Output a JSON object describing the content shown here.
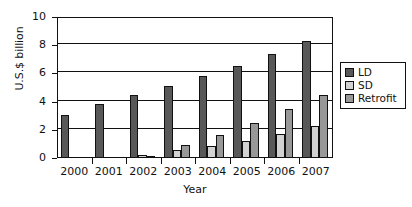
{
  "chart_data": {
    "type": "bar",
    "title": "",
    "xlabel": "Year",
    "ylabel": "U.S.$ billion",
    "categories": [
      "2000",
      "2001",
      "2002",
      "2003",
      "2004",
      "2005",
      "2006",
      "2007"
    ],
    "series": [
      {
        "name": "LD",
        "color": "#585858",
        "values": [
          3.05,
          3.8,
          4.5,
          5.1,
          5.85,
          6.5,
          7.35,
          8.3
        ]
      },
      {
        "name": "SD",
        "color": "#d2d2d2",
        "values": [
          0,
          0,
          0.2,
          0.55,
          0.85,
          1.2,
          1.7,
          2.3
        ]
      },
      {
        "name": "Retrofit",
        "color": "#989898",
        "values": [
          0,
          0,
          0.15,
          0.9,
          1.65,
          2.5,
          3.5,
          4.5
        ]
      }
    ],
    "ylim": [
      0,
      10
    ],
    "yticks": [
      0,
      2,
      4,
      6,
      8,
      10
    ],
    "ytick_labels": [
      "0",
      "2",
      "4",
      "6",
      "8",
      "10"
    ],
    "grid": "horizontal",
    "legend_position": "right",
    "legend_entries": [
      "LD",
      "SD",
      "Retrofit"
    ]
  }
}
